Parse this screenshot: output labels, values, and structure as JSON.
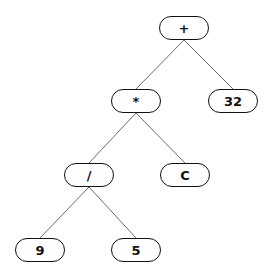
{
  "diagram": {
    "type": "expression-tree",
    "nodes": [
      {
        "id": "n1",
        "label": "+",
        "cx": 184,
        "cy": 28
      },
      {
        "id": "n2",
        "label": "*",
        "cx": 136,
        "cy": 101
      },
      {
        "id": "n3",
        "label": "32",
        "cx": 233,
        "cy": 101
      },
      {
        "id": "n4",
        "label": "/",
        "cx": 89,
        "cy": 175
      },
      {
        "id": "n5",
        "label": "C",
        "cx": 185,
        "cy": 175
      },
      {
        "id": "n6",
        "label": "9",
        "cx": 40,
        "cy": 250
      },
      {
        "id": "n7",
        "label": "5",
        "cx": 136,
        "cy": 250
      }
    ],
    "edges": [
      {
        "from": "n1",
        "to": "n2"
      },
      {
        "from": "n1",
        "to": "n3"
      },
      {
        "from": "n2",
        "to": "n4"
      },
      {
        "from": "n2",
        "to": "n5"
      },
      {
        "from": "n4",
        "to": "n6"
      },
      {
        "from": "n4",
        "to": "n7"
      }
    ]
  },
  "labels": {
    "root": "+",
    "multiply": "*",
    "thirty_two": "32",
    "divide": "/",
    "c": "C",
    "nine": "9",
    "five": "5"
  }
}
